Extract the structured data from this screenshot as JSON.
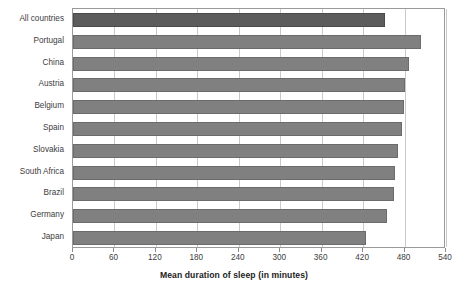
{
  "chart_data": {
    "type": "bar",
    "orientation": "horizontal",
    "title": "",
    "xlabel": "Mean duration of sleep (in minutes)",
    "ylabel": "",
    "xlim": [
      0,
      540
    ],
    "xticks": [
      0,
      60,
      120,
      180,
      240,
      300,
      360,
      420,
      480,
      540
    ],
    "grid": true,
    "legend": false,
    "categories": [
      "All countries",
      "Portugal",
      "China",
      "Austria",
      "Belgium",
      "Spain",
      "Slovakia",
      "South Africa",
      "Brazil",
      "Germany",
      "Japan"
    ],
    "values": [
      451,
      504,
      486,
      480,
      479,
      477,
      471,
      466,
      464,
      455,
      424
    ],
    "highlight_index": 0,
    "colors": {
      "bar": "#808080",
      "bar_border": "#6b6b6b",
      "bar_highlight": "#5c5c5c",
      "bar_highlight_border": "#4a4a4a",
      "gridline": "#c9c9c9",
      "frame": "#9a9a9a",
      "text": "#3d3d3d",
      "title_text": "#222222",
      "background": "#ffffff"
    }
  }
}
